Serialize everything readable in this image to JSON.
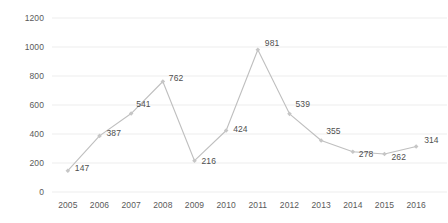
{
  "chart_data": {
    "type": "line",
    "title": "",
    "xlabel": "",
    "ylabel": "",
    "categories": [
      "2005",
      "2006",
      "2007",
      "2008",
      "2009",
      "2010",
      "2011",
      "2012",
      "2013",
      "2014",
      "2015",
      "2016"
    ],
    "values": [
      147,
      387,
      541,
      762,
      216,
      424,
      981,
      539,
      355,
      278,
      262,
      314
    ],
    "point_labels": [
      "147",
      "387",
      "541",
      "762",
      "216",
      "424",
      "981",
      "539",
      "355",
      "278",
      "262",
      "314"
    ],
    "ylim": [
      0,
      1200
    ],
    "ytick_labels": [
      "0",
      "200",
      "400",
      "600",
      "800",
      "1000",
      "1200"
    ],
    "ytick_values": [
      0,
      200,
      400,
      600,
      800,
      1000,
      1200
    ],
    "grid": true,
    "grid_axis": "y",
    "legend": false,
    "legend_position": "none",
    "series": [
      {
        "name": "",
        "values": [
          147,
          387,
          541,
          762,
          216,
          424,
          981,
          539,
          355,
          278,
          262,
          314
        ]
      }
    ],
    "colors": {
      "line": "#BFBFBF",
      "marker": "#C6C6C6",
      "grid": "#EDEDED",
      "tick_text": "#5A5A5A",
      "label_text": "#4F4F4F",
      "background": "#FFFFFF"
    }
  }
}
